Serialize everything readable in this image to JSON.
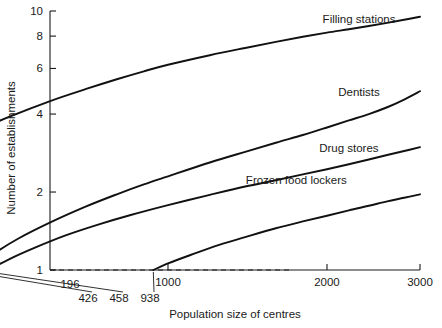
{
  "chart_data": {
    "type": "line",
    "title": "",
    "xlabel": "Population size of centres",
    "ylabel": "Number of establishments",
    "xscale": "log",
    "yscale": "log",
    "xlim": [
      150,
      3000
    ],
    "ylim": [
      1,
      10
    ],
    "grid": false,
    "legend_position": "inline-right-of-curve",
    "x_ticks": [
      196,
      1000,
      2000,
      3000
    ],
    "x_tick_labels": [
      "196",
      "1000",
      "2000",
      "3000"
    ],
    "y_ticks": [
      1,
      2,
      4,
      6,
      8,
      10
    ],
    "y_tick_labels": [
      "1",
      "2",
      "4",
      "6",
      "8",
      "10"
    ],
    "threshold_labels": [
      "196",
      "426",
      "458",
      "938"
    ],
    "threshold_values": [
      196,
      426,
      458,
      938
    ],
    "threshold_line_y": 1,
    "annotations": [
      {
        "text": "Filling stations",
        "x": 2300,
        "y": 9.0
      },
      {
        "text": "Dentists",
        "x": 2300,
        "y": 4.7
      },
      {
        "text": "Drug stores",
        "x": 2200,
        "y": 2.85
      },
      {
        "text": "Frozen food lockers",
        "x": 1750,
        "y": 2.15
      }
    ],
    "series": [
      {
        "name": "Filling stations",
        "threshold": 196,
        "label": "Filling stations",
        "points": [
          [
            196,
            1.0
          ],
          [
            210,
            1.22
          ],
          [
            230,
            1.5
          ],
          [
            260,
            1.86
          ],
          [
            300,
            2.3
          ],
          [
            350,
            2.78
          ],
          [
            420,
            3.35
          ],
          [
            500,
            3.9
          ],
          [
            600,
            4.5
          ],
          [
            700,
            5.0
          ],
          [
            800,
            5.45
          ],
          [
            900,
            5.85
          ],
          [
            1000,
            6.2
          ],
          [
            1200,
            6.75
          ],
          [
            1400,
            7.2
          ],
          [
            1600,
            7.6
          ],
          [
            1800,
            7.95
          ],
          [
            2000,
            8.25
          ],
          [
            2200,
            8.5
          ],
          [
            2400,
            8.75
          ],
          [
            2600,
            9.0
          ],
          [
            2800,
            9.25
          ],
          [
            3000,
            9.5
          ]
        ]
      },
      {
        "name": "Dentists",
        "threshold": 426,
        "label": "Dentists",
        "points": [
          [
            426,
            1.0
          ],
          [
            460,
            1.13
          ],
          [
            520,
            1.32
          ],
          [
            600,
            1.53
          ],
          [
            700,
            1.76
          ],
          [
            800,
            1.96
          ],
          [
            900,
            2.14
          ],
          [
            1000,
            2.3
          ],
          [
            1200,
            2.6
          ],
          [
            1400,
            2.86
          ],
          [
            1600,
            3.1
          ],
          [
            1800,
            3.32
          ],
          [
            2000,
            3.55
          ],
          [
            2200,
            3.78
          ],
          [
            2400,
            4.0
          ],
          [
            2600,
            4.25
          ],
          [
            2800,
            4.55
          ],
          [
            3000,
            4.9
          ]
        ]
      },
      {
        "name": "Drug stores",
        "threshold": 458,
        "label": "Drug stores",
        "points": [
          [
            458,
            1.0
          ],
          [
            500,
            1.1
          ],
          [
            560,
            1.22
          ],
          [
            640,
            1.36
          ],
          [
            740,
            1.5
          ],
          [
            850,
            1.63
          ],
          [
            1000,
            1.78
          ],
          [
            1200,
            1.95
          ],
          [
            1400,
            2.1
          ],
          [
            1600,
            2.22
          ],
          [
            1800,
            2.34
          ],
          [
            2000,
            2.45
          ],
          [
            2200,
            2.56
          ],
          [
            2400,
            2.67
          ],
          [
            2600,
            2.78
          ],
          [
            2800,
            2.88
          ],
          [
            3000,
            2.98
          ]
        ]
      },
      {
        "name": "Frozen food lockers",
        "threshold": 938,
        "label": "Frozen food lockers",
        "points": [
          [
            938,
            1.0
          ],
          [
            1000,
            1.06
          ],
          [
            1100,
            1.14
          ],
          [
            1250,
            1.25
          ],
          [
            1400,
            1.34
          ],
          [
            1600,
            1.45
          ],
          [
            1800,
            1.54
          ],
          [
            2000,
            1.62
          ],
          [
            2200,
            1.7
          ],
          [
            2400,
            1.77
          ],
          [
            2600,
            1.84
          ],
          [
            2800,
            1.9
          ],
          [
            3000,
            1.96
          ]
        ]
      }
    ]
  }
}
